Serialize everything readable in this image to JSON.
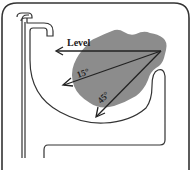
{
  "diagram": {
    "labels": {
      "level": "Level",
      "angle_15": "15°",
      "angle_45": "45°"
    },
    "colors": {
      "line": "#333333",
      "blob": "#8a8a8a",
      "frame": "#333333",
      "background": "#ffffff"
    },
    "arrows": [
      {
        "name": "level",
        "from": [
          161,
          51
        ],
        "to": [
          56,
          51
        ]
      },
      {
        "name": "15-degree",
        "from": [
          161,
          51
        ],
        "to": [
          63,
          85
        ]
      },
      {
        "name": "45-degree",
        "from": [
          161,
          51
        ],
        "to": [
          97,
          116
        ]
      }
    ],
    "caption_fragment": "Figure ... (text cut off at bottom)"
  }
}
